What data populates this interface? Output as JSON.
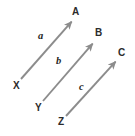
{
  "figure": {
    "kind": "vector-diagram",
    "background_color": "#ffffff",
    "arrow_color": "#8c8c8c",
    "label_color": "#2b2b2b",
    "vector_label_color": "#1f1f1f"
  },
  "nodes": {
    "tails": [
      {
        "id": "x",
        "label": "X",
        "x": 13,
        "y": 81
      },
      {
        "id": "y",
        "label": "Y",
        "x": 35,
        "y": 103
      },
      {
        "id": "z",
        "label": "Z",
        "x": 58,
        "y": 117
      }
    ],
    "heads": [
      {
        "id": "a",
        "label": "A",
        "x": 72,
        "y": 7
      },
      {
        "id": "b",
        "label": "B",
        "x": 95,
        "y": 28
      },
      {
        "id": "c",
        "label": "C",
        "x": 118,
        "y": 48
      }
    ]
  },
  "vectors": [
    {
      "id": "vector-a",
      "label": "a",
      "from": "X",
      "to": "A",
      "label_x": 38,
      "label_y": 31,
      "x1": 21,
      "y1": 79,
      "x2": 74,
      "y2": 19
    },
    {
      "id": "vector-b",
      "label": "b",
      "from": "Y",
      "to": "B",
      "label_x": 56,
      "label_y": 56,
      "x1": 43,
      "y1": 101,
      "x2": 95,
      "y2": 41
    },
    {
      "id": "vector-c",
      "label": "c",
      "from": "Z",
      "to": "C",
      "label_x": 79,
      "label_y": 82,
      "x1": 66,
      "y1": 116,
      "x2": 118,
      "y2": 59
    }
  ]
}
